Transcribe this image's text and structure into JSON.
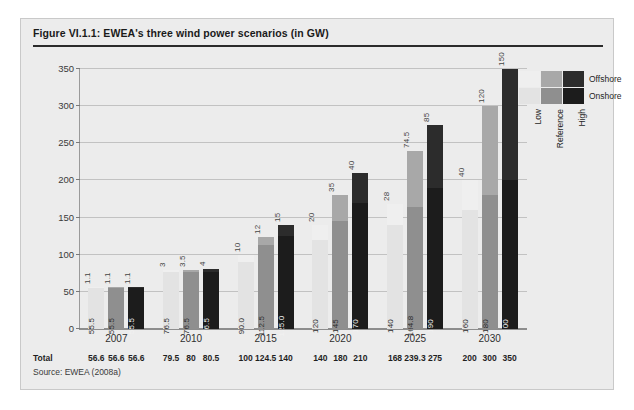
{
  "figure": {
    "title": "Figure VI.1.1: EWEA's three wind power scenarios (in GW)",
    "source": "Source: EWEA (2008a)",
    "total_row_label": "Total"
  },
  "legend": {
    "rows": [
      {
        "key": "offshore",
        "label": "Offshore"
      },
      {
        "key": "onshore",
        "label": "Onshore"
      }
    ],
    "columns": [
      {
        "key": "low",
        "label": "Low"
      },
      {
        "key": "reference",
        "label": "Reference"
      },
      {
        "key": "high",
        "label": "High"
      }
    ]
  },
  "colors": {
    "low_onshore": "#e3e3e3",
    "low_offshore": "#efefef",
    "reference_onshore": "#8f8f8f",
    "reference_offshore": "#a8a8a8",
    "high_onshore": "#1c1c1c",
    "high_offshore": "#2c2c2c",
    "panel_background": "#ececec",
    "gridline": "#c2c2c2",
    "axis": "#8d8d8d",
    "title_rule": "#2b2b2b"
  },
  "chart_data": {
    "type": "bar",
    "title": "Figure VI.1.1: EWEA's three wind power scenarios (in GW)",
    "xlabel": "",
    "ylabel": "",
    "ylim": [
      0,
      350
    ],
    "yticks": [
      0,
      50,
      100,
      150,
      200,
      250,
      300,
      350
    ],
    "grid": true,
    "stacked": true,
    "legend_position": "right",
    "units": "GW",
    "categories": [
      "2007",
      "2010",
      "2015",
      "2020",
      "2025",
      "2030"
    ],
    "scenarios": [
      "Low",
      "Reference",
      "High"
    ],
    "series": [
      {
        "name": "Onshore",
        "scenario_values": {
          "Low": [
            55.5,
            76.5,
            90.0,
            120,
            140,
            160
          ],
          "Reference": [
            55.5,
            76.5,
            112.5,
            145,
            164.8,
            180
          ],
          "High": [
            55.5,
            76.5,
            125.0,
            170,
            190,
            200
          ]
        },
        "scenario_labels": {
          "Low": [
            "55.5",
            "76.5",
            "90.0",
            "120",
            "140",
            "160"
          ],
          "Reference": [
            "55.5",
            "76.5",
            "112.5",
            "145",
            "164.8",
            "180"
          ],
          "High": [
            "55.5",
            "76.5",
            "125.0",
            "170",
            "190",
            "200"
          ]
        }
      },
      {
        "name": "Offshore",
        "scenario_values": {
          "Low": [
            1.1,
            3,
            10,
            20,
            28,
            40
          ],
          "Reference": [
            1.1,
            3.5,
            12,
            35,
            74.5,
            120
          ],
          "High": [
            1.1,
            4,
            15,
            40,
            85,
            150
          ]
        },
        "scenario_labels": {
          "Low": [
            "1.1",
            "3",
            "10",
            "20",
            "28",
            "40"
          ],
          "Reference": [
            "1.1",
            "3.5",
            "12",
            "35",
            "74.5",
            "120"
          ],
          "High": [
            "1.1",
            "4",
            "15",
            "40",
            "85",
            "150"
          ]
        }
      }
    ],
    "totals": {
      "Low": [
        "56.6",
        "79.5",
        "100",
        "140",
        "168",
        "200"
      ],
      "Reference": [
        "56.6",
        "80",
        "124.5",
        "180",
        "239.3",
        "300"
      ],
      "High": [
        "56.6",
        "80.5",
        "140",
        "210",
        "275",
        "350"
      ]
    }
  }
}
